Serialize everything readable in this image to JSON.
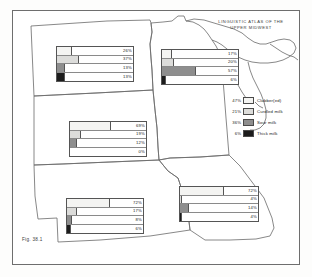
{
  "title": {
    "line1": "LINGUISTIC ATLAS OF THE",
    "line2": "UPPER MIDWEST"
  },
  "figure_caption": "Fig. 38.1",
  "legend": {
    "items": [
      {
        "pct": "47%",
        "label": "Clabber(ed)",
        "color": "#f4f4f2"
      },
      {
        "pct": "21%",
        "label": "Curdled milk",
        "color": "#dcdcda"
      },
      {
        "pct": "36%",
        "label": "Sour milk",
        "color": "#8e8e8e"
      },
      {
        "pct": "6%",
        "label": "Thick milk",
        "color": "#1c1c1c"
      }
    ]
  },
  "chart_data": {
    "type": "bar",
    "title": "LINGUISTIC ATLAS OF THE UPPER MIDWEST",
    "xlabel": "",
    "ylabel": "",
    "xlim": [
      0,
      100
    ],
    "grid": false,
    "legend_position": "right",
    "categories": [
      "Clabber(ed)",
      "Curdled milk",
      "Sour milk",
      "Thick milk"
    ],
    "panels": [
      {
        "name": "north-dakota",
        "values": [
          26,
          37,
          13,
          13
        ],
        "labels": [
          "26%",
          "37%",
          "13%",
          "13%"
        ]
      },
      {
        "name": "minnesota",
        "values": [
          17,
          20,
          57,
          6
        ],
        "labels": [
          "17%",
          "20%",
          "57%",
          "6%"
        ]
      },
      {
        "name": "south-dakota",
        "values": [
          69,
          19,
          12,
          0
        ],
        "labels": [
          "69%",
          "19%",
          "12%",
          "0%"
        ]
      },
      {
        "name": "nebraska",
        "values": [
          72,
          17,
          8,
          6
        ],
        "labels": [
          "72%",
          "17%",
          "8%",
          "6%"
        ]
      },
      {
        "name": "iowa",
        "values": [
          72,
          4,
          14,
          4
        ],
        "labels": [
          "72%",
          "4%",
          "14%",
          "4%"
        ]
      }
    ],
    "totals": {
      "values": [
        47,
        21,
        36,
        6
      ],
      "labels": [
        "47%",
        "21%",
        "36%",
        "6%"
      ]
    }
  }
}
